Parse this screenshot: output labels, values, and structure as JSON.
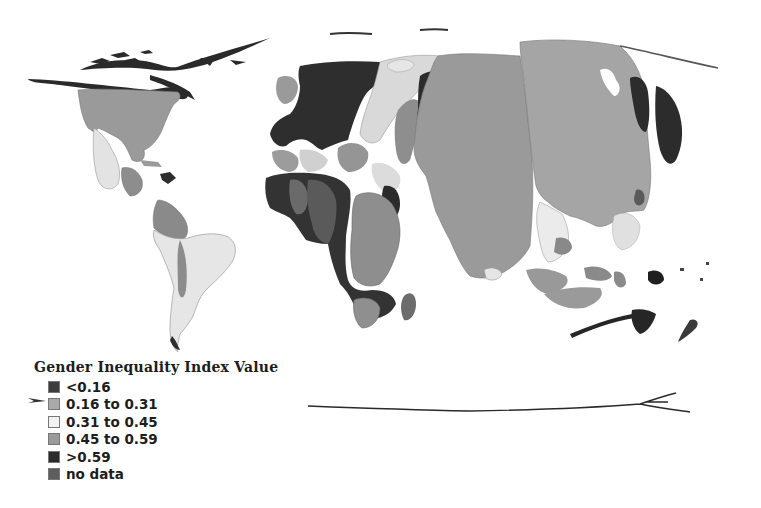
{
  "map": {
    "type": "cartogram",
    "color_scheme": "grayscale",
    "legend": {
      "title": "Gender Inequality Index Value",
      "items": [
        {
          "label": "<0.16",
          "color": "#3d3d3d"
        },
        {
          "label": "0.16 to 0.31",
          "color": "#a9a9a9"
        },
        {
          "label": "0.31 to 0.45",
          "color": "#f2f2f2"
        },
        {
          "label": "0.45 to 0.59",
          "color": "#9a9a9a"
        },
        {
          "label": ">0.59",
          "color": "#2b2b2b"
        },
        {
          "label": "no data",
          "color": "#5e5e5e"
        }
      ]
    },
    "regions": [
      {
        "name": "north-america",
        "color": "#9a9a9a"
      },
      {
        "name": "mexico-central-america",
        "color": "#e4e4e4"
      },
      {
        "name": "south-america",
        "color": "#e8e8e8"
      },
      {
        "name": "europe",
        "color": "#2e2e2e"
      },
      {
        "name": "russia-central-asia",
        "color": "#d8d8d8"
      },
      {
        "name": "africa-west",
        "color": "#333333"
      },
      {
        "name": "africa-east",
        "color": "#8f8f8f"
      },
      {
        "name": "india",
        "color": "#9a9a9a"
      },
      {
        "name": "china",
        "color": "#a5a5a5"
      },
      {
        "name": "japan-korea",
        "color": "#2c2c2c"
      },
      {
        "name": "southeast-asia",
        "color": "#ebebeb"
      },
      {
        "name": "indonesia",
        "color": "#999999"
      },
      {
        "name": "australia",
        "color": "#262626"
      }
    ]
  }
}
